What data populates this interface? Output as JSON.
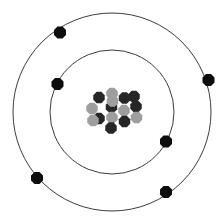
{
  "figure": {
    "name": "bohr-atomic-model",
    "background_color": "#ffffff",
    "width": 224,
    "height": 224
  },
  "nucleus": {
    "label": "nucleus",
    "center": {
      "x": 112,
      "y": 112
    },
    "proton_color": "#262626",
    "neutron_color": "#9e9e9e",
    "particle_radius": 6.2,
    "particle_count": 15,
    "proton_count": 9,
    "neutron_count": 6,
    "particles": [
      {
        "type": "neutron",
        "x": 112.0,
        "y": 93.5
      },
      {
        "type": "proton",
        "x": 99.0,
        "y": 97.5
      },
      {
        "type": "proton",
        "x": 124.5,
        "y": 98.0
      },
      {
        "type": "proton",
        "x": 111.5,
        "y": 107.0
      },
      {
        "type": "proton",
        "x": 136.0,
        "y": 106.5
      },
      {
        "type": "neutron",
        "x": 92.0,
        "y": 108.5
      },
      {
        "type": "neutron",
        "x": 124.0,
        "y": 110.5
      },
      {
        "type": "proton",
        "x": 99.0,
        "y": 118.5
      },
      {
        "type": "neutron",
        "x": 112.0,
        "y": 117.5
      },
      {
        "type": "proton",
        "x": 124.5,
        "y": 121.5
      },
      {
        "type": "neutron",
        "x": 136.5,
        "y": 117.5
      },
      {
        "type": "neutron",
        "x": 93.0,
        "y": 120.5
      },
      {
        "type": "proton",
        "x": 111.0,
        "y": 128.0
      },
      {
        "type": "proton",
        "x": 134.0,
        "y": 96.5
      },
      {
        "type": "neutron",
        "x": 112.5,
        "y": 101.0
      }
    ]
  },
  "orbits": [
    {
      "name": "inner-shell",
      "label": "inner electron shell",
      "center": {
        "x": 112,
        "y": 112
      },
      "radius": 62,
      "stroke_color": "#3c3c3c",
      "stroke_width": 1,
      "electron_count": 2,
      "electrons": [
        {
          "label": "inner-electron-1",
          "x": 57.5,
          "y": 84.0
        },
        {
          "label": "inner-electron-2",
          "x": 166.0,
          "y": 141.5
        }
      ]
    },
    {
      "name": "outer-shell",
      "label": "outer electron shell",
      "center": {
        "x": 112,
        "y": 112
      },
      "radius": 99,
      "stroke_color": "#3c3c3c",
      "stroke_width": 1,
      "electron_count": 4,
      "electrons": [
        {
          "label": "outer-electron-1",
          "x": 60.0,
          "y": 32.5
        },
        {
          "label": "outer-electron-2",
          "x": 208.5,
          "y": 80.0
        },
        {
          "label": "outer-electron-3",
          "x": 37.0,
          "y": 178.0
        },
        {
          "label": "outer-electron-4",
          "x": 166.0,
          "y": 192.0
        }
      ]
    }
  ],
  "electron": {
    "color": "#0d0d0d",
    "radius": 6.5
  }
}
